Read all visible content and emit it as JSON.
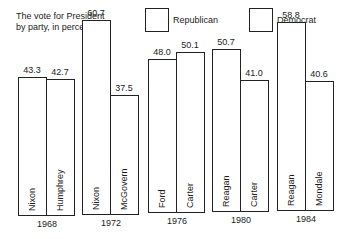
{
  "chart_data": {
    "type": "bar",
    "title": "The vote for President by party, in percentage.",
    "title_lines": [
      "The vote for President",
      "by party, in percentage."
    ],
    "legend": [
      "Republican",
      "Democrat"
    ],
    "categories": [
      "1968",
      "1972",
      "1976",
      "1980",
      "1984"
    ],
    "series": [
      {
        "name": "Republican",
        "candidates": [
          "Nixon",
          "Nixon",
          "Ford",
          "Reagan",
          "Reagan"
        ],
        "values": [
          43.3,
          60.7,
          48.0,
          50.7,
          58.8
        ]
      },
      {
        "name": "Democrat",
        "candidates": [
          "Humphrey",
          "McGovern",
          "Carter",
          "Carter",
          "Mondale"
        ],
        "values": [
          42.7,
          37.5,
          50.1,
          41.0,
          40.6
        ]
      }
    ],
    "value_labels": {
      "Republican": [
        "43.3",
        "60.7",
        "48.0",
        "50.7",
        "58.8"
      ],
      "Democrat": [
        "42.7",
        "37.5",
        "50.1",
        "41.0",
        "40.6"
      ]
    },
    "xlabel": "",
    "ylabel": "",
    "grid": false,
    "legend_position": "top"
  }
}
